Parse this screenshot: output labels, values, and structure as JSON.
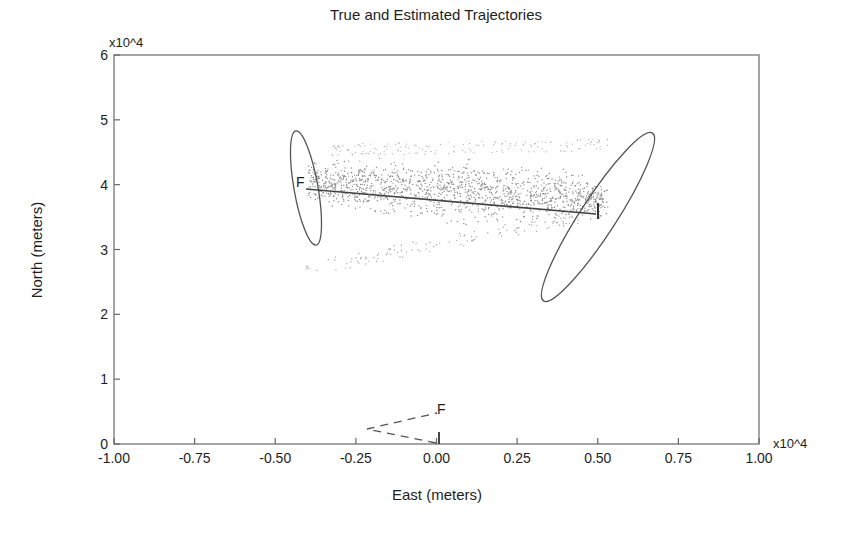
{
  "chart_data": {
    "type": "scatter",
    "title": "True and Estimated Trajectories",
    "xlabel": "East (meters)",
    "ylabel": "North (meters)",
    "x_multiplier": "x10^4",
    "y_multiplier": "x10^4",
    "xlim": [
      -1.0,
      1.0
    ],
    "ylim": [
      0,
      6
    ],
    "xticks": [
      "-1.00",
      "-0.75",
      "-0.50",
      "-0.25",
      "0.00",
      "0.25",
      "0.50",
      "0.75",
      "1.00"
    ],
    "yticks": [
      "0",
      "1",
      "2",
      "3",
      "4",
      "5",
      "6"
    ],
    "grid": false,
    "legend": null,
    "series": [
      {
        "name": "Estimated trajectory (solid)",
        "style": "solid",
        "points": [
          [
            0.5,
            3.55
          ],
          [
            -0.42,
            3.93
          ]
        ],
        "start_label": "I",
        "end_label": "F"
      },
      {
        "name": "True trajectory (dashed)",
        "style": "dashed",
        "points": [
          [
            0.0,
            0.0
          ],
          [
            -0.22,
            0.22
          ],
          [
            0.0,
            0.48
          ]
        ],
        "start_label": "I",
        "end_label": "F"
      },
      {
        "name": "Particle cloud",
        "style": "dots",
        "x_range": [
          -0.42,
          0.55
        ],
        "y_range": [
          2.7,
          4.4
        ]
      }
    ],
    "ellipses": [
      {
        "name": "final-uncertainty",
        "center": [
          -0.41,
          3.93
        ],
        "semi_major": 0.88,
        "semi_minor": 0.19,
        "note": "near-vertical, slightly tilted"
      },
      {
        "name": "initial-uncertainty",
        "center": [
          0.5,
          3.5
        ],
        "semi_major": 1.55,
        "semi_minor": 0.28,
        "note": "tilted ~35deg from vertical"
      }
    ]
  },
  "labels": {
    "title": "True and Estimated Trajectories",
    "xlabel": "East (meters)",
    "ylabel": "North (meters)",
    "x_mult": "x10^4",
    "y_mult": "x10^4",
    "solid_F": "F",
    "solid_I": "I",
    "dashed_F": "F",
    "dashed_I": "I"
  },
  "colors": {
    "axis": "#5a5a5a",
    "line": "#4a4a4a",
    "dots": "#8a8a8a",
    "text": "#1e1e1e"
  }
}
